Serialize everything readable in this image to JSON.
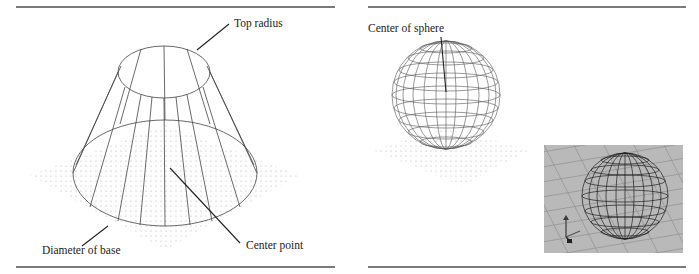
{
  "figure_left": {
    "title": "Cone frustum wireframe",
    "labels": {
      "top_radius": "Top radius",
      "diameter_of_base": "Diameter of base",
      "center_point": "Center point"
    }
  },
  "figure_right": {
    "title": "Sphere wireframe",
    "labels": {
      "center_of_sphere": "Center of sphere"
    },
    "inset": {
      "description": "Rendered viewport of wireframe sphere on grid with axis tripod"
    }
  },
  "colors": {
    "rule": "#7a7a7a",
    "line": "#333333",
    "grid_dot": "#b0b0b0",
    "inset_bg": "#b9b9b9"
  }
}
